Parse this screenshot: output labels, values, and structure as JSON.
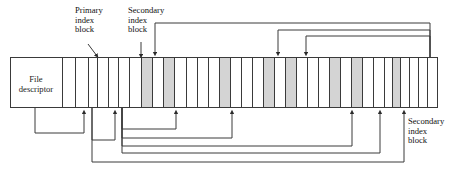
{
  "diagram": {
    "type": "file-index-block-diagram",
    "canvas": {
      "width": 450,
      "height": 180
    },
    "colors": {
      "stroke": "#3a3a3a",
      "shaded_cell_fill": "#d4d4d4",
      "empty_cell_fill": "#ffffff",
      "background": "#ffffff"
    },
    "file_descriptor": {
      "label_line1": "File",
      "label_line2": "descriptor",
      "x": 10,
      "y": 57,
      "width": 52,
      "height": 51
    },
    "labels": {
      "primary_index_block": {
        "line1": "Primary",
        "line2": "index",
        "line3": "block"
      },
      "secondary_index_block_top": {
        "line1": "Secondary",
        "line2": "index",
        "line3": "block"
      },
      "secondary_index_block_right": {
        "line1": "Secondary",
        "line2": "index",
        "line3": "block"
      }
    },
    "block_row": {
      "x": 10,
      "y": 57,
      "width": 428,
      "height": 51,
      "cell_boundaries": [
        62,
        75,
        88,
        97,
        108,
        118,
        129,
        141,
        152,
        163,
        174,
        186,
        197,
        208,
        219,
        230,
        241,
        252,
        263,
        274,
        285,
        296,
        307,
        318,
        329,
        340,
        351,
        362,
        373,
        384,
        392,
        400,
        409,
        418,
        427,
        438
      ],
      "shaded_cells": [
        {
          "x": 141,
          "width": 11
        },
        {
          "x": 163,
          "width": 11
        },
        {
          "x": 219,
          "width": 11
        },
        {
          "x": 263,
          "width": 11
        },
        {
          "x": 285,
          "width": 11
        },
        {
          "x": 329,
          "width": 11
        },
        {
          "x": 351,
          "width": 11
        },
        {
          "x": 392,
          "width": 8
        }
      ]
    },
    "callout_arrows": [
      {
        "name": "primary-index-callout",
        "from_x": 88,
        "from_y": 44,
        "to_x": 97,
        "to_y": 56
      },
      {
        "name": "secondary-index-callout",
        "from_x": 141,
        "from_y": 42,
        "to_x": 141,
        "to_y": 56
      }
    ],
    "top_connectors": [
      {
        "name": "top-connector-1",
        "source_x": 430,
        "rail_y": 23,
        "target_x": 155,
        "target_y": 56
      },
      {
        "name": "top-connector-2",
        "source_x": 430,
        "rail_y": 30,
        "target_x": 278,
        "target_y": 56
      },
      {
        "name": "top-connector-3",
        "source_x": 430,
        "rail_y": 36,
        "target_x": 306,
        "target_y": 56
      }
    ],
    "bottom_connectors": [
      {
        "name": "bottom-connector-1",
        "source_x": 35,
        "rail_y": 133,
        "target_x": 84,
        "target_y": 110
      },
      {
        "name": "bottom-connector-2",
        "source_x": 92,
        "rail_y": 140,
        "target_x": 115,
        "target_y": 110
      },
      {
        "name": "bottom-connector-3",
        "source_x": 122,
        "rail_y": 129,
        "target_x": 176,
        "target_y": 110
      },
      {
        "name": "bottom-connector-4",
        "source_x": 122,
        "rail_y": 138,
        "target_x": 232,
        "target_y": 110
      },
      {
        "name": "bottom-connector-5",
        "source_x": 122,
        "rail_y": 146,
        "target_x": 352,
        "target_y": 110
      },
      {
        "name": "bottom-connector-6",
        "source_x": 122,
        "rail_y": 153,
        "target_x": 380,
        "target_y": 110
      },
      {
        "name": "bottom-connector-7",
        "source_x": 92,
        "rail_y": 162,
        "target_x": 404,
        "target_y": 110
      }
    ]
  }
}
